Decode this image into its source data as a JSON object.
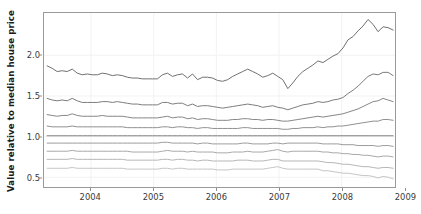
{
  "chart_data": {
    "type": "line",
    "title": "",
    "xlabel": "",
    "ylabel": "Value relative to median house price",
    "xlim": [
      2003.25,
      2008.85
    ],
    "ylim": [
      0.38,
      2.52
    ],
    "xticks": [
      2004,
      2005,
      2006,
      2007,
      2008,
      2009
    ],
    "xtick_labels": [
      "2004",
      "2005",
      "2006",
      "2007",
      "2008",
      "2009"
    ],
    "yticks": [
      0.5,
      1.0,
      1.5,
      2.0
    ],
    "ytick_labels": [
      "0.5",
      "1.0",
      "1.5",
      "2.0"
    ],
    "grid": true,
    "legend": "none",
    "x": [
      2003.3,
      2003.38,
      2003.46,
      2003.54,
      2003.62,
      2003.7,
      2003.78,
      2003.86,
      2003.94,
      2004.02,
      2004.1,
      2004.18,
      2004.26,
      2004.34,
      2004.42,
      2004.5,
      2004.58,
      2004.66,
      2004.74,
      2004.82,
      2004.9,
      2004.98,
      2005.06,
      2005.14,
      2005.22,
      2005.3,
      2005.38,
      2005.46,
      2005.54,
      2005.62,
      2005.7,
      2005.78,
      2005.86,
      2005.94,
      2006.02,
      2006.1,
      2006.18,
      2006.26,
      2006.34,
      2006.42,
      2006.5,
      2006.58,
      2006.66,
      2006.74,
      2006.82,
      2006.9,
      2006.98,
      2007.06,
      2007.14,
      2007.22,
      2007.3,
      2007.38,
      2007.46,
      2007.54,
      2007.62,
      2007.7,
      2007.78,
      2007.86,
      2007.94,
      2008.02,
      2008.1,
      2008.18,
      2008.26,
      2008.34,
      2008.42,
      2008.5,
      2008.58,
      2008.66,
      2008.74,
      2008.82
    ],
    "series": [
      {
        "name": "decile-9",
        "color": "#6e6e6e",
        "values": [
          1.87,
          1.84,
          1.8,
          1.81,
          1.8,
          1.83,
          1.78,
          1.76,
          1.77,
          1.76,
          1.76,
          1.78,
          1.77,
          1.75,
          1.76,
          1.75,
          1.73,
          1.72,
          1.72,
          1.71,
          1.71,
          1.71,
          1.71,
          1.76,
          1.78,
          1.74,
          1.76,
          1.77,
          1.72,
          1.77,
          1.7,
          1.73,
          1.73,
          1.72,
          1.69,
          1.68,
          1.7,
          1.74,
          1.77,
          1.8,
          1.83,
          1.8,
          1.77,
          1.73,
          1.75,
          1.78,
          1.74,
          1.7,
          1.59,
          1.66,
          1.74,
          1.8,
          1.84,
          1.88,
          1.93,
          1.91,
          1.95,
          1.99,
          2.02,
          2.09,
          2.19,
          2.23,
          2.3,
          2.36,
          2.44,
          2.38,
          2.29,
          2.35,
          2.34,
          2.31
        ]
      },
      {
        "name": "decile-8",
        "color": "#7a7a7a",
        "values": [
          1.47,
          1.45,
          1.44,
          1.45,
          1.44,
          1.47,
          1.44,
          1.42,
          1.42,
          1.42,
          1.42,
          1.43,
          1.43,
          1.42,
          1.43,
          1.42,
          1.41,
          1.4,
          1.4,
          1.39,
          1.39,
          1.39,
          1.39,
          1.42,
          1.42,
          1.4,
          1.41,
          1.41,
          1.38,
          1.4,
          1.37,
          1.38,
          1.38,
          1.37,
          1.36,
          1.35,
          1.36,
          1.37,
          1.38,
          1.39,
          1.4,
          1.39,
          1.38,
          1.36,
          1.37,
          1.38,
          1.36,
          1.35,
          1.33,
          1.35,
          1.37,
          1.39,
          1.4,
          1.41,
          1.43,
          1.42,
          1.43,
          1.45,
          1.46,
          1.48,
          1.53,
          1.57,
          1.62,
          1.68,
          1.74,
          1.77,
          1.76,
          1.79,
          1.79,
          1.75
        ]
      },
      {
        "name": "decile-7",
        "color": "#858585",
        "values": [
          1.27,
          1.26,
          1.25,
          1.26,
          1.26,
          1.28,
          1.26,
          1.25,
          1.25,
          1.25,
          1.25,
          1.26,
          1.25,
          1.25,
          1.25,
          1.25,
          1.24,
          1.23,
          1.23,
          1.23,
          1.23,
          1.23,
          1.23,
          1.24,
          1.25,
          1.23,
          1.24,
          1.24,
          1.22,
          1.23,
          1.21,
          1.22,
          1.22,
          1.21,
          1.2,
          1.2,
          1.2,
          1.21,
          1.21,
          1.22,
          1.22,
          1.21,
          1.21,
          1.2,
          1.21,
          1.21,
          1.2,
          1.19,
          1.19,
          1.2,
          1.21,
          1.22,
          1.23,
          1.24,
          1.25,
          1.24,
          1.25,
          1.26,
          1.27,
          1.28,
          1.3,
          1.32,
          1.34,
          1.37,
          1.4,
          1.43,
          1.44,
          1.47,
          1.45,
          1.43
        ]
      },
      {
        "name": "decile-6",
        "color": "#8f8f8f",
        "values": [
          1.13,
          1.12,
          1.12,
          1.12,
          1.12,
          1.13,
          1.12,
          1.12,
          1.12,
          1.12,
          1.12,
          1.12,
          1.12,
          1.12,
          1.12,
          1.12,
          1.11,
          1.11,
          1.11,
          1.11,
          1.11,
          1.11,
          1.11,
          1.12,
          1.12,
          1.11,
          1.12,
          1.12,
          1.11,
          1.11,
          1.1,
          1.11,
          1.11,
          1.1,
          1.1,
          1.1,
          1.1,
          1.1,
          1.1,
          1.11,
          1.11,
          1.1,
          1.1,
          1.1,
          1.1,
          1.1,
          1.1,
          1.09,
          1.09,
          1.1,
          1.1,
          1.11,
          1.11,
          1.11,
          1.12,
          1.11,
          1.12,
          1.12,
          1.13,
          1.13,
          1.14,
          1.15,
          1.16,
          1.17,
          1.18,
          1.19,
          1.19,
          1.21,
          1.21,
          1.2
        ]
      },
      {
        "name": "median",
        "color": "#7d7d7d",
        "values": [
          1.01,
          1.01,
          1.01,
          1.01,
          1.01,
          1.01,
          1.01,
          1.01,
          1.01,
          1.01,
          1.01,
          1.01,
          1.01,
          1.01,
          1.01,
          1.01,
          1.01,
          1.01,
          1.01,
          1.01,
          1.01,
          1.01,
          1.01,
          1.01,
          1.01,
          1.01,
          1.01,
          1.01,
          1.01,
          1.01,
          1.01,
          1.01,
          1.01,
          1.01,
          1.01,
          1.01,
          1.01,
          1.01,
          1.01,
          1.01,
          1.01,
          1.01,
          1.01,
          1.01,
          1.01,
          1.01,
          1.01,
          1.01,
          1.01,
          1.01,
          1.01,
          1.01,
          1.01,
          1.01,
          1.01,
          1.01,
          1.01,
          1.01,
          1.01,
          1.01,
          1.01,
          1.01,
          1.01,
          1.01,
          1.01,
          1.01,
          1.01,
          1.01,
          1.01,
          1.01
        ]
      },
      {
        "name": "decile-4",
        "color": "#9b9b9b",
        "values": [
          0.92,
          0.92,
          0.92,
          0.92,
          0.92,
          0.92,
          0.92,
          0.92,
          0.92,
          0.92,
          0.92,
          0.92,
          0.92,
          0.92,
          0.92,
          0.92,
          0.92,
          0.92,
          0.92,
          0.92,
          0.92,
          0.92,
          0.92,
          0.93,
          0.93,
          0.92,
          0.92,
          0.92,
          0.92,
          0.92,
          0.91,
          0.92,
          0.92,
          0.91,
          0.91,
          0.91,
          0.91,
          0.91,
          0.91,
          0.92,
          0.92,
          0.91,
          0.91,
          0.91,
          0.91,
          0.92,
          0.92,
          0.91,
          0.92,
          0.92,
          0.92,
          0.92,
          0.92,
          0.92,
          0.92,
          0.91,
          0.91,
          0.91,
          0.91,
          0.9,
          0.9,
          0.9,
          0.89,
          0.89,
          0.89,
          0.89,
          0.88,
          0.89,
          0.89,
          0.88
        ]
      },
      {
        "name": "decile-3",
        "color": "#a8a8a8",
        "values": [
          0.82,
          0.82,
          0.82,
          0.82,
          0.82,
          0.83,
          0.82,
          0.82,
          0.82,
          0.82,
          0.82,
          0.82,
          0.82,
          0.82,
          0.82,
          0.82,
          0.82,
          0.81,
          0.81,
          0.81,
          0.81,
          0.81,
          0.81,
          0.82,
          0.83,
          0.82,
          0.82,
          0.82,
          0.81,
          0.82,
          0.81,
          0.81,
          0.81,
          0.81,
          0.8,
          0.8,
          0.8,
          0.81,
          0.81,
          0.81,
          0.82,
          0.81,
          0.81,
          0.81,
          0.82,
          0.83,
          0.84,
          0.82,
          0.81,
          0.82,
          0.82,
          0.82,
          0.82,
          0.82,
          0.82,
          0.81,
          0.81,
          0.8,
          0.8,
          0.79,
          0.79,
          0.78,
          0.78,
          0.77,
          0.77,
          0.76,
          0.75,
          0.76,
          0.76,
          0.75
        ]
      },
      {
        "name": "decile-2",
        "color": "#b5b5b5",
        "values": [
          0.72,
          0.72,
          0.72,
          0.72,
          0.72,
          0.73,
          0.72,
          0.72,
          0.72,
          0.72,
          0.72,
          0.72,
          0.72,
          0.72,
          0.72,
          0.72,
          0.71,
          0.71,
          0.71,
          0.71,
          0.71,
          0.71,
          0.71,
          0.72,
          0.72,
          0.71,
          0.72,
          0.72,
          0.71,
          0.71,
          0.7,
          0.71,
          0.71,
          0.7,
          0.7,
          0.7,
          0.7,
          0.7,
          0.71,
          0.71,
          0.71,
          0.7,
          0.7,
          0.7,
          0.71,
          0.72,
          0.72,
          0.7,
          0.7,
          0.7,
          0.7,
          0.7,
          0.7,
          0.7,
          0.7,
          0.69,
          0.68,
          0.68,
          0.67,
          0.66,
          0.66,
          0.65,
          0.64,
          0.63,
          0.63,
          0.62,
          0.61,
          0.62,
          0.62,
          0.61
        ]
      },
      {
        "name": "decile-1",
        "color": "#c4c4c4",
        "values": [
          0.61,
          0.61,
          0.61,
          0.61,
          0.61,
          0.62,
          0.61,
          0.61,
          0.61,
          0.61,
          0.61,
          0.61,
          0.61,
          0.61,
          0.61,
          0.61,
          0.6,
          0.6,
          0.6,
          0.6,
          0.6,
          0.6,
          0.6,
          0.61,
          0.61,
          0.6,
          0.61,
          0.61,
          0.6,
          0.6,
          0.6,
          0.6,
          0.6,
          0.6,
          0.59,
          0.59,
          0.59,
          0.6,
          0.6,
          0.6,
          0.6,
          0.6,
          0.6,
          0.6,
          0.61,
          0.62,
          0.63,
          0.61,
          0.6,
          0.6,
          0.6,
          0.6,
          0.6,
          0.6,
          0.6,
          0.58,
          0.58,
          0.57,
          0.56,
          0.55,
          0.55,
          0.54,
          0.53,
          0.52,
          0.52,
          0.51,
          0.49,
          0.51,
          0.5,
          0.48
        ]
      }
    ]
  }
}
